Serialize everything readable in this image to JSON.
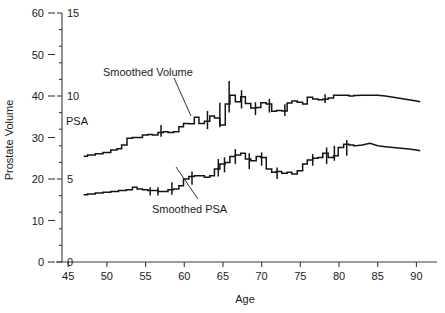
{
  "chart_data": {
    "type": "line",
    "title": "",
    "xlabel": "Age",
    "ylabel": "Prostate Volume",
    "ylabel_secondary": "PSA",
    "xlim": [
      44.2,
      91.5
    ],
    "ylim": [
      0,
      62
    ],
    "ylim_secondary": [
      0,
      15.5
    ],
    "grid": false,
    "legend": "none",
    "x_ticks": [
      45,
      50,
      55,
      60,
      65,
      70,
      75,
      80,
      85,
      90
    ],
    "y_ticks_left": [
      0,
      10,
      20,
      30,
      40,
      50,
      60
    ],
    "y_ticks_right": [
      0,
      5,
      10,
      15
    ],
    "annotations": [
      {
        "text": "Smoothed Volume",
        "x": 60.0,
        "y": 45.0
      },
      {
        "text": "Smoothed PSA",
        "x": 63.5,
        "y": 8.0
      },
      {
        "text": "PSA",
        "x": 49.5,
        "y": 34.5
      }
    ],
    "series": [
      {
        "name": "Smoothed Volume",
        "axis": "left",
        "units": "mL",
        "x": [
          47.0,
          48.0,
          49.0,
          50.0,
          51.0,
          51.6,
          52.2,
          53.0,
          53.6,
          54.2,
          55.0,
          55.6,
          56.2,
          57.0,
          57.6,
          58.2,
          59.0,
          59.6,
          60.2,
          61.0,
          61.6,
          62.2,
          63.0,
          63.6,
          64.2,
          65.0,
          65.6,
          66.2,
          67.0,
          67.6,
          68.2,
          69.0,
          69.6,
          70.2,
          71.0,
          71.6,
          72.2,
          73.0,
          73.6,
          74.2,
          75.0,
          75.6,
          76.2,
          77.0,
          77.6,
          78.2,
          79.0,
          79.6,
          80.2,
          81.0,
          81.6,
          82.2,
          83.0,
          84.0,
          85.0,
          86.0,
          87.0,
          88.0,
          89.0,
          90.0,
          90.5
        ],
        "values": [
          25.5,
          25.8,
          26.1,
          26.4,
          27.0,
          27.3,
          28.2,
          29.8,
          30.0,
          30.0,
          30.6,
          30.7,
          30.6,
          31.2,
          31.4,
          31.2,
          31.4,
          32.6,
          33.4,
          33.3,
          34.9,
          33.4,
          33.9,
          35.2,
          34.7,
          33.0,
          38.1,
          40.2,
          38.6,
          39.8,
          38.2,
          37.1,
          37.2,
          38.4,
          38.1,
          36.3,
          36.5,
          36.4,
          38.3,
          38.8,
          38.5,
          38.1,
          39.7,
          39.3,
          39.1,
          39.2,
          39.5,
          40.2,
          40.2,
          40.2,
          40.0,
          40.1,
          40.2,
          40.2,
          40.2,
          40.0,
          39.7,
          39.4,
          39.1,
          38.8,
          38.6
        ],
        "error_bars": [
          {
            "x": 57.0,
            "low": 30.2,
            "high": 33.0
          },
          {
            "x": 63.0,
            "low": 32.0,
            "high": 36.4
          },
          {
            "x": 64.6,
            "low": 32.5,
            "high": 38.4
          },
          {
            "x": 65.8,
            "low": 36.0,
            "high": 43.6
          },
          {
            "x": 67.4,
            "low": 37.0,
            "high": 41.4
          },
          {
            "x": 69.2,
            "low": 35.4,
            "high": 38.5
          },
          {
            "x": 71.0,
            "low": 36.0,
            "high": 39.3
          },
          {
            "x": 73.0,
            "low": 35.2,
            "high": 38.0
          },
          {
            "x": 78.2,
            "low": 38.3,
            "high": 40.4
          }
        ]
      },
      {
        "name": "Smoothed PSA",
        "axis": "right",
        "units": "ng/mL",
        "x": [
          47.0,
          48.0,
          49.0,
          50.0,
          51.0,
          52.0,
          53.0,
          53.6,
          54.2,
          55.0,
          55.6,
          56.2,
          57.0,
          57.6,
          58.2,
          59.0,
          59.6,
          60.2,
          61.0,
          61.6,
          62.2,
          63.0,
          63.6,
          64.2,
          65.0,
          65.6,
          66.2,
          67.0,
          67.6,
          68.2,
          69.0,
          69.6,
          70.2,
          71.0,
          71.6,
          72.2,
          73.0,
          73.6,
          74.2,
          75.0,
          75.6,
          76.2,
          77.0,
          77.6,
          78.2,
          79.0,
          79.6,
          80.2,
          81.0,
          81.6,
          82.2,
          83.0,
          84.0,
          85.0,
          86.0,
          87.0,
          88.0,
          89.0,
          90.0,
          90.5
        ],
        "values": [
          4.05,
          4.1,
          4.15,
          4.2,
          4.25,
          4.3,
          4.35,
          4.5,
          4.4,
          4.35,
          4.3,
          4.3,
          4.25,
          4.25,
          4.35,
          4.4,
          4.6,
          5.0,
          5.15,
          5.2,
          5.2,
          5.1,
          5.2,
          5.6,
          5.9,
          6.0,
          6.35,
          6.45,
          6.55,
          6.2,
          6.1,
          6.35,
          6.3,
          5.6,
          5.4,
          5.45,
          5.35,
          5.4,
          5.3,
          5.5,
          5.9,
          6.15,
          6.25,
          6.3,
          6.55,
          6.3,
          6.4,
          6.9,
          7.1,
          7.05,
          7.0,
          7.05,
          7.15,
          7.0,
          6.95,
          6.9,
          6.85,
          6.8,
          6.75,
          6.7
        ],
        "error_bars": [
          {
            "x": 55.6,
            "low": 4.0,
            "high": 4.5
          },
          {
            "x": 56.6,
            "low": 4.0,
            "high": 4.5
          },
          {
            "x": 58.4,
            "low": 4.05,
            "high": 4.8
          },
          {
            "x": 61.0,
            "low": 4.65,
            "high": 5.45
          },
          {
            "x": 64.4,
            "low": 5.15,
            "high": 6.2
          },
          {
            "x": 65.2,
            "low": 5.4,
            "high": 6.3
          },
          {
            "x": 66.6,
            "low": 5.9,
            "high": 6.8
          },
          {
            "x": 68.4,
            "low": 5.6,
            "high": 6.55
          },
          {
            "x": 70.0,
            "low": 5.8,
            "high": 6.6
          },
          {
            "x": 72.0,
            "low": 5.0,
            "high": 5.7
          },
          {
            "x": 76.6,
            "low": 5.8,
            "high": 6.5
          },
          {
            "x": 78.4,
            "low": 5.9,
            "high": 6.9
          },
          {
            "x": 79.4,
            "low": 6.1,
            "high": 7.0
          },
          {
            "x": 81.0,
            "low": 6.4,
            "high": 7.35
          }
        ]
      }
    ]
  },
  "axes": {
    "x_axis_title": "Age",
    "y_axis_title": "Prostate Volume"
  },
  "colors": {
    "line": "#141414",
    "axis": "#3a3a3a",
    "text": "#1a1a1a",
    "background": "#ffffff"
  }
}
